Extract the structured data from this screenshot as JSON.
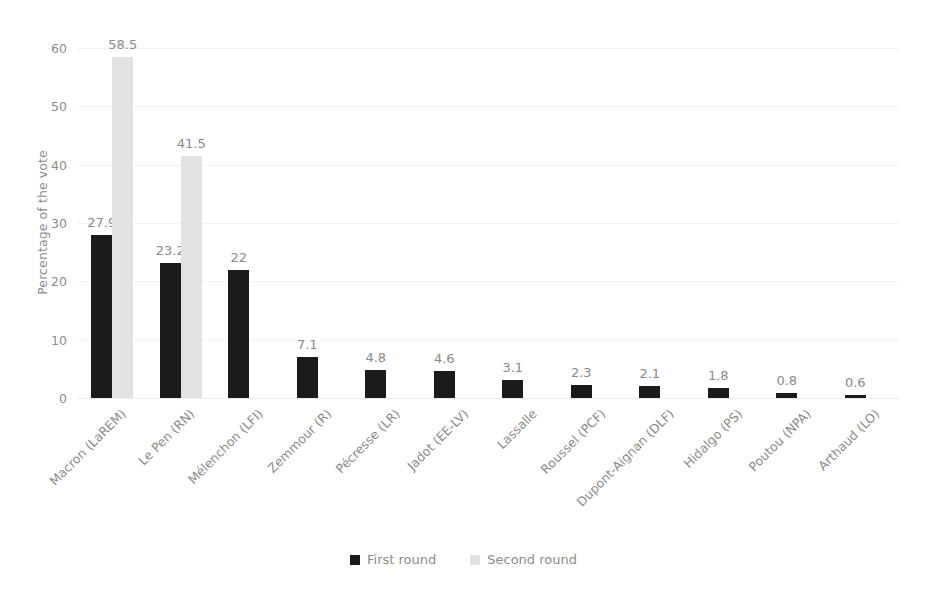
{
  "chart_data": {
    "type": "bar",
    "title": "",
    "xlabel": "",
    "ylabel": "Percentage of the vote",
    "ylim": [
      0,
      60
    ],
    "yticks": [
      0,
      10,
      20,
      30,
      40,
      50,
      60
    ],
    "grid": true,
    "legend_position": "bottom",
    "categories": [
      "Macron (LaREM)",
      "Le Pen (RN)",
      "Mélenchon (LFI)",
      "Zemmour (R)",
      "Pécresse (LR)",
      "Jadot (EE-LV)",
      "Lassalle",
      "Roussel (PCF)",
      "Dupont-Aignan (DLF)",
      "Hidalgo (PS)",
      "Poutou (NPA)",
      "Arthaud (LO)"
    ],
    "series": [
      {
        "name": "First round",
        "color": "#1b1b1b",
        "values": [
          27.9,
          23.2,
          22,
          7.1,
          4.8,
          4.6,
          3.1,
          2.3,
          2.1,
          1.8,
          0.8,
          0.6
        ],
        "labels": [
          "27.9",
          "23.2",
          "22",
          "7.1",
          "4.8",
          "4.6",
          "3.1",
          "2.3",
          "2.1",
          "1.8",
          "0.8",
          "0.6"
        ]
      },
      {
        "name": "Second round",
        "color": "#e2e2e2",
        "values": [
          58.5,
          41.5,
          null,
          null,
          null,
          null,
          null,
          null,
          null,
          null,
          null,
          null
        ],
        "labels": [
          "58.5",
          "41.5",
          "",
          "",
          "",
          "",
          "",
          "",
          "",
          "",
          "",
          ""
        ]
      }
    ]
  },
  "legend": {
    "items": [
      {
        "label": "First round",
        "color": "#1b1b1b"
      },
      {
        "label": "Second round",
        "color": "#e2e2e2"
      }
    ]
  }
}
